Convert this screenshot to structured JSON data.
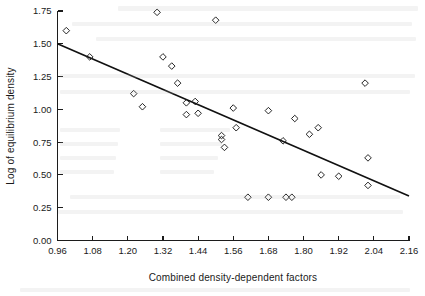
{
  "chart_data": {
    "type": "scatter",
    "title": "",
    "xlabel": "Combined density-dependent factors",
    "ylabel": "Log of equilibrium density",
    "xlim": [
      0.96,
      2.16
    ],
    "ylim": [
      0.0,
      1.75
    ],
    "xticks": [
      0.96,
      1.08,
      1.2,
      1.32,
      1.44,
      1.56,
      1.68,
      1.8,
      1.92,
      2.04,
      2.16
    ],
    "xtick_labels": [
      "0.96",
      "1.08",
      "1.20",
      "1.32",
      "1.44",
      "1.56",
      "1.68",
      "1.80",
      "1.92",
      "2.04",
      "2.16"
    ],
    "yticks": [
      0.0,
      0.25,
      0.5,
      0.75,
      1.0,
      1.25,
      1.5,
      1.75
    ],
    "ytick_labels": [
      "0.00",
      "0.25",
      "0.50",
      "0.75",
      "1.00",
      "1.25",
      "1.50",
      "1.75"
    ],
    "grid": false,
    "legend": false,
    "marker": "open-diamond",
    "marker_color": "#1a1a1a",
    "line_color": "#111111",
    "points": [
      {
        "x": 0.99,
        "y": 1.6
      },
      {
        "x": 1.07,
        "y": 1.4
      },
      {
        "x": 1.22,
        "y": 1.12
      },
      {
        "x": 1.25,
        "y": 1.02
      },
      {
        "x": 1.3,
        "y": 1.74
      },
      {
        "x": 1.32,
        "y": 1.4
      },
      {
        "x": 1.35,
        "y": 1.33
      },
      {
        "x": 1.37,
        "y": 1.2
      },
      {
        "x": 1.4,
        "y": 1.05
      },
      {
        "x": 1.4,
        "y": 0.96
      },
      {
        "x": 1.43,
        "y": 1.06
      },
      {
        "x": 1.44,
        "y": 0.97
      },
      {
        "x": 1.5,
        "y": 1.68
      },
      {
        "x": 1.52,
        "y": 0.8
      },
      {
        "x": 1.52,
        "y": 0.77
      },
      {
        "x": 1.53,
        "y": 0.71
      },
      {
        "x": 1.56,
        "y": 1.01
      },
      {
        "x": 1.57,
        "y": 0.86
      },
      {
        "x": 1.61,
        "y": 0.33
      },
      {
        "x": 1.68,
        "y": 0.99
      },
      {
        "x": 1.68,
        "y": 0.33
      },
      {
        "x": 1.73,
        "y": 0.76
      },
      {
        "x": 1.74,
        "y": 0.33
      },
      {
        "x": 1.76,
        "y": 0.33
      },
      {
        "x": 1.77,
        "y": 0.93
      },
      {
        "x": 1.82,
        "y": 0.81
      },
      {
        "x": 1.85,
        "y": 0.86
      },
      {
        "x": 1.86,
        "y": 0.5
      },
      {
        "x": 1.92,
        "y": 0.49
      },
      {
        "x": 2.01,
        "y": 1.2
      },
      {
        "x": 2.02,
        "y": 0.63
      },
      {
        "x": 2.02,
        "y": 0.42
      }
    ],
    "fit_line": {
      "name": "regression line",
      "x": [
        0.96,
        2.16
      ],
      "y": [
        1.5,
        0.34
      ]
    }
  }
}
